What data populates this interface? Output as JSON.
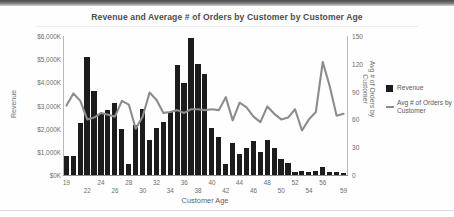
{
  "chart_data": {
    "type": "bar",
    "title": "Revenue and Average # of Orders by Customer by Customer Age",
    "xlabel": "Customer Age",
    "ylabel": "Revenue",
    "y2label": "Avg # of Orders by Customer",
    "ylim": [
      0,
      6000
    ],
    "y2lim": [
      0,
      150
    ],
    "ytick_labels": [
      "$6,000K",
      "$5,000K",
      "$4,000K",
      "$3,000K",
      "$2,000K",
      "$1,000K",
      "$0K"
    ],
    "ytick_values": [
      6000,
      5000,
      4000,
      3000,
      2000,
      1000,
      0
    ],
    "y2tick_labels": [
      "150",
      "120",
      "90",
      "60",
      "30",
      "0"
    ],
    "y2tick_values": [
      150,
      120,
      90,
      60,
      30,
      0
    ],
    "grid": false,
    "legend_position": "right",
    "categories": [
      19,
      20,
      21,
      22,
      23,
      24,
      25,
      26,
      27,
      28,
      29,
      30,
      31,
      32,
      33,
      34,
      35,
      36,
      37,
      38,
      39,
      40,
      41,
      42,
      43,
      44,
      45,
      46,
      47,
      48,
      49,
      50,
      51,
      52,
      53,
      54,
      55,
      56,
      57,
      58,
      59
    ],
    "xtick_labels_top": [
      "19",
      "24",
      "28",
      "32",
      "36",
      "40",
      "44",
      "48",
      "52",
      "56"
    ],
    "xtick_labels_bottom": [
      "22",
      "26",
      "30",
      "34",
      "38",
      "42",
      "46",
      "50",
      "54",
      "59"
    ],
    "series": [
      {
        "name": "Revenue",
        "type": "bar",
        "axis": "left",
        "color": "#1c1c1c",
        "values": [
          830,
          830,
          2240,
          5110,
          3620,
          2620,
          2810,
          3100,
          2000,
          480,
          2140,
          2830,
          1500,
          2020,
          2300,
          2700,
          4750,
          3980,
          5900,
          4800,
          4350,
          2010,
          1620,
          480,
          1370,
          890,
          1170,
          1480,
          980,
          1500,
          1150,
          700,
          520,
          120,
          170,
          120,
          160,
          330,
          110,
          120,
          90
        ]
      },
      {
        "name": "Avg # of Orders by Customer",
        "type": "line",
        "axis": "right",
        "color": "#8c8c8c",
        "values": [
          75,
          88,
          80,
          60,
          62,
          67,
          65,
          63,
          80,
          76,
          50,
          63,
          89,
          81,
          67,
          68,
          70,
          67,
          71,
          71,
          70,
          71,
          70,
          84,
          59,
          78,
          73,
          63,
          57,
          74,
          66,
          60,
          62,
          71,
          48,
          60,
          68,
          122,
          96,
          64,
          66
        ]
      }
    ]
  },
  "legend": {
    "items": [
      {
        "label": "Revenue",
        "marker": "square"
      },
      {
        "label": "Avg # of Orders by Customer",
        "marker": "line"
      }
    ]
  }
}
